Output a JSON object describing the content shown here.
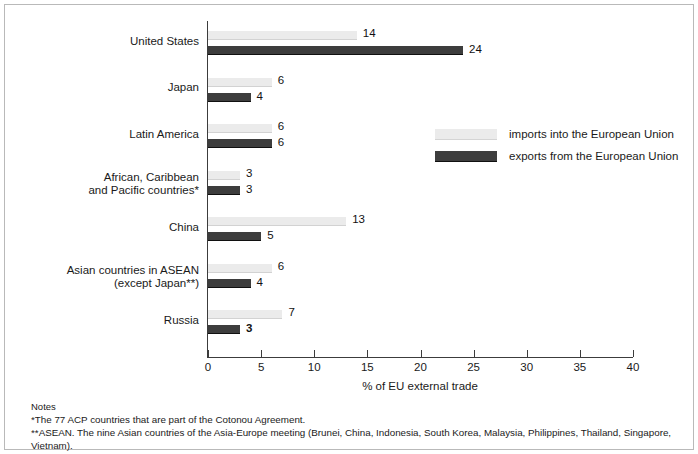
{
  "chart_data": {
    "type": "bar",
    "orientation": "horizontal",
    "title": "",
    "xlabel": "% of EU external trade",
    "ylabel": "",
    "xlim": [
      0,
      40
    ],
    "xticks": [
      0,
      5,
      10,
      15,
      20,
      25,
      30,
      35,
      40
    ],
    "grid": false,
    "legend_position": "right-middle",
    "categories": [
      "United States",
      "Japan",
      "Latin America",
      "African, Caribbean\nand Pacific countries*",
      "China",
      "Asian countries in ASEAN\n(except Japan**)",
      "Russia"
    ],
    "series": [
      {
        "name": "imports into the European Union",
        "color": "#ebebeb",
        "values": [
          14,
          6,
          6,
          3,
          13,
          6,
          7
        ]
      },
      {
        "name": "exports from the European Union",
        "color": "#3d3d3d",
        "values": [
          24,
          4,
          6,
          3,
          5,
          4,
          3
        ]
      }
    ]
  },
  "axis": {
    "tick_labels": [
      "0",
      "5",
      "10",
      "15",
      "20",
      "25",
      "30",
      "35",
      "40"
    ],
    "title": "% of EU external trade"
  },
  "categories": [
    {
      "line1": "United States",
      "line2": ""
    },
    {
      "line1": "Japan",
      "line2": ""
    },
    {
      "line1": "Latin America",
      "line2": ""
    },
    {
      "line1": "African, Caribbean",
      "line2": "and Pacific countries*"
    },
    {
      "line1": "China",
      "line2": ""
    },
    {
      "line1": "Asian countries in ASEAN",
      "line2": "(except Japan**)"
    },
    {
      "line1": "Russia",
      "line2": ""
    }
  ],
  "values": {
    "imports": [
      "14",
      "6",
      "6",
      "3",
      "13",
      "6",
      "7"
    ],
    "exports": [
      "24",
      "4",
      "6",
      "3",
      "5",
      "4",
      "3"
    ]
  },
  "legend": {
    "imports_label": "imports into the European Union",
    "exports_label": "exports from the European Union"
  },
  "notes": {
    "heading": "Notes",
    "line1": "*The 77 ACP countries that are part of the Cotonou Agreement.",
    "line2": "**ASEAN. The nine Asian countries of the Asia-Europe meeting (Brunei, China, Indonesia, South Korea, Malaysia, Philippines, Thailand, Singapore, Vietnam)."
  },
  "colors": {
    "imports": "#ebebeb",
    "exports": "#3d3d3d",
    "axis": "#3c3c3c",
    "border": "#b9b9b9"
  }
}
